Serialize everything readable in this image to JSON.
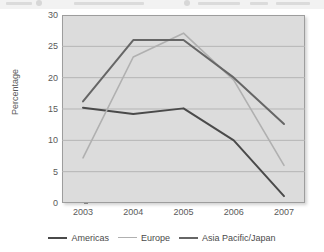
{
  "top_strip": {
    "note": "cropped caption remnant"
  },
  "chart_data": {
    "type": "line",
    "title": "",
    "xlabel": "",
    "ylabel": "Percentage",
    "categories": [
      "2003",
      "2004",
      "2005",
      "2006",
      "2007"
    ],
    "ylim": [
      0,
      30
    ],
    "yticks": [
      0,
      5,
      10,
      15,
      20,
      25,
      30
    ],
    "ytick_labels": [
      "0",
      "5",
      "10",
      "15",
      "20",
      "25",
      "30"
    ],
    "grid": true,
    "legend_position": "bottom",
    "series": [
      {
        "name": "Americas",
        "color": "#4a4a4a",
        "values": [
          15.2,
          14.2,
          15.1,
          10.0,
          1.1
        ]
      },
      {
        "name": "Europe",
        "color": "#b0b0b0",
        "values": [
          7.2,
          23.3,
          27.1,
          19.6,
          6.0
        ]
      },
      {
        "name": "Asia Pacific/Japan",
        "color": "#666666",
        "values": [
          16.2,
          26.0,
          26.0,
          20.0,
          12.6
        ]
      }
    ]
  },
  "colors": {
    "plot_background": "#dcdcdc",
    "plot_border": "#9d9d9d",
    "gridline": "#b5b5b5",
    "tick_text": "#5a5a5a",
    "legend_text": "#4a4a4a"
  }
}
